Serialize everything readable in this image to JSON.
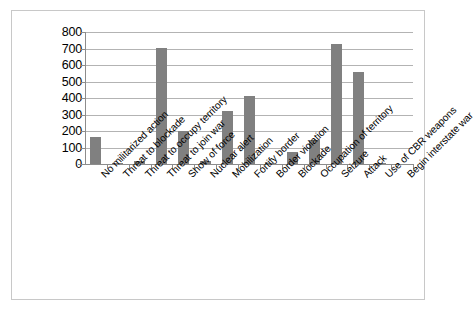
{
  "chart_data": {
    "type": "bar",
    "title": "",
    "subtitle": "",
    "xlabel": "",
    "ylabel": "",
    "ylim": [
      0,
      800
    ],
    "ytick_step": 100,
    "yticks": [
      800,
      700,
      600,
      500,
      400,
      300,
      200,
      100,
      0
    ],
    "grid": true,
    "legend": false,
    "legend_position": "none",
    "bar_color": "#808080",
    "gridline_color": "#b3b3b3",
    "axis_color": "#8c8c8c",
    "border_color": "#c8c8c8",
    "categories": [
      "No militarized action",
      "Threat to blockade",
      "Threat to occupy territory",
      "Threat to join war",
      "Show of force",
      "Nuclear alert",
      "Mobilization",
      "Fortify border",
      "Border violation",
      "Blockade",
      "Occupation of territory",
      "Seizure",
      "Attack",
      "Use of CBR weapons",
      "Begin interstate war"
    ],
    "values": [
      163,
      3,
      20,
      702,
      203,
      19,
      320,
      415,
      5,
      72,
      146,
      730,
      558,
      6,
      0
    ]
  },
  "axis": {
    "y_tick_labels": [
      "800",
      "700",
      "600",
      "500",
      "400",
      "300",
      "200",
      "100",
      "0"
    ]
  }
}
